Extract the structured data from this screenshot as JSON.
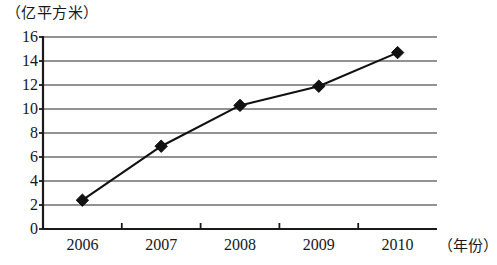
{
  "chart_data": {
    "type": "line",
    "title": "",
    "subtitle": "",
    "xlabel": "（年份）",
    "ylabel": "（亿平方米）",
    "categories": [
      "2006",
      "2007",
      "2008",
      "2009",
      "2010"
    ],
    "x": [
      2006,
      2007,
      2008,
      2009,
      2010
    ],
    "values": [
      2.4,
      6.9,
      10.3,
      11.9,
      14.7
    ],
    "series": [
      {
        "name": "",
        "values": [
          2.4,
          6.9,
          10.3,
          11.9,
          14.7
        ]
      }
    ],
    "ylim": [
      0,
      16
    ],
    "ytick_step": 2,
    "y_ticks": [
      "16",
      "14",
      "12",
      "10",
      "8",
      "6",
      "4",
      "2",
      "0"
    ],
    "y_tick_values": [
      16,
      14,
      12,
      10,
      8,
      6,
      4,
      2,
      0
    ],
    "xlim": [
      2005.5,
      2010.5
    ],
    "grid": "horizontal",
    "legend": "none",
    "marker": "diamond",
    "line_color": "#111111",
    "marker_color": "#111111",
    "grid_color": "#6e6e6e",
    "axis_color": "#1a1a1a",
    "background_color": "#ffffff",
    "annotations": []
  },
  "axes": {
    "y_unit_caption": "（亿平方米）",
    "x_unit_caption": "（年份）"
  }
}
